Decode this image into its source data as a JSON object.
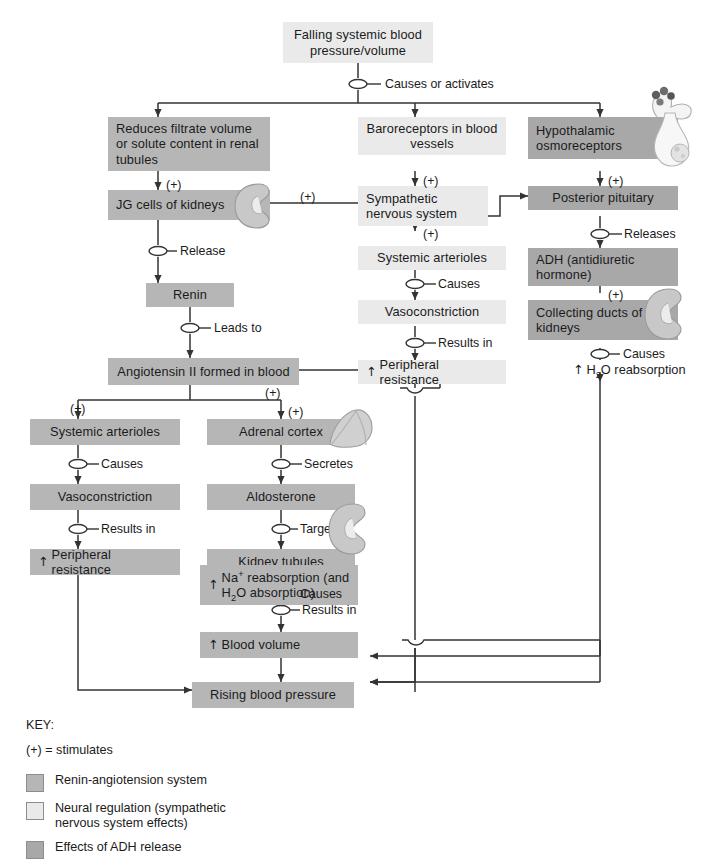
{
  "diagram": {
    "colors": {
      "renin_system": "#b6b6b6",
      "neural_regulation": "#eaeaea",
      "adh_effects": "#a8a8a8",
      "line": "#333333",
      "text": "#1b1b1b",
      "background": "#ffffff"
    },
    "nodes": {
      "falling_bp": "Falling systemic blood pressure/volume",
      "reduces_filtrate": "Reduces filtrate volume or solute content in renal tubules",
      "jg_cells": "JG cells of kidneys",
      "renin": "Renin",
      "angiotensin": "Angiotensin II formed in blood",
      "baroreceptors": "Baroreceptors in blood vessels",
      "sympathetic": "Sympathetic nervous system",
      "systemic_arterioles_mid": "Systemic arterioles",
      "vasoconstriction_mid": "Vasoconstriction",
      "peripheral_resistance_mid": "Peripheral resistance",
      "hypothalamic": "Hypothalamic osmoreceptors",
      "posterior_pituitary": "Posterior pituitary",
      "adh": "ADH (antidiuretic hormone)",
      "collecting_ducts": "Collecting ducts of kidneys",
      "h2o_reabsorption": "H2O reabsorption",
      "systemic_arterioles_left": "Systemic arterioles",
      "vasoconstriction_left": "Vasoconstriction",
      "peripheral_resistance_left": "Peripheral resistance",
      "adrenal_cortex": "Adrenal cortex",
      "aldosterone": "Aldosterone",
      "kidney_tubules": "Kidney tubules",
      "na_reabsorption": "Na+ reabsorption (and H2O absorption)",
      "blood_volume": "Blood volume",
      "rising_bp": "Rising blood pressure"
    },
    "edge_labels": {
      "causes_or_activates": "Causes or activates",
      "release": "Release",
      "leads_to": "Leads to",
      "causes_mid": "Causes",
      "results_in_mid": "Results in",
      "releases": "Releases",
      "causes_adh": "Causes",
      "causes_left": "Causes",
      "results_in_left": "Results in",
      "secretes": "Secretes",
      "targets": "Targets",
      "causes_kidney": "Causes",
      "results_in_na": "Results in"
    },
    "plus_markers": {
      "p1": "(+)",
      "p2": "(+)",
      "p3": "(+)",
      "p4": "(+)",
      "p5": "(+)",
      "p6": "(+)",
      "p7": "(+)",
      "p8": "(+)",
      "p9": "(+)"
    },
    "key": {
      "title": "KEY:",
      "stimulates": "(+) = stimulates",
      "items": [
        {
          "label": "Renin-angiotension system",
          "color": "#b6b6b6"
        },
        {
          "label": "Neural regulation (sympathetic nervous system effects)",
          "color": "#eaeaea"
        },
        {
          "label": "Effects of ADH release",
          "color": "#a8a8a8"
        }
      ]
    },
    "illustrations": [
      {
        "name": "pituitary-hypothalamus-illustration"
      },
      {
        "name": "kidney-illustration-jg"
      },
      {
        "name": "kidney-illustration-collecting-ducts"
      },
      {
        "name": "adrenal-gland-illustration"
      },
      {
        "name": "kidney-illustration-tubules"
      }
    ]
  }
}
